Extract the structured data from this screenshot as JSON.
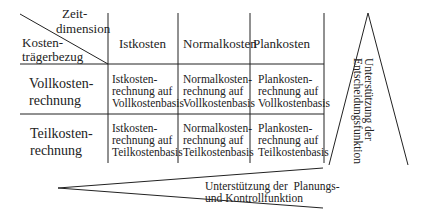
{
  "corner": {
    "top": [
      "Zeit-",
      "dimension"
    ],
    "bottom": [
      "Kosten-",
      "trägerbezug"
    ]
  },
  "columns": [
    "Istkosten",
    "Normalkosten",
    "Plankosten"
  ],
  "rows": [
    {
      "label": [
        "Vollkosten-",
        "rechnung"
      ],
      "cells": [
        [
          "Istkosten-",
          "rechnung auf",
          "Vollkostenbasis"
        ],
        [
          "Normalkosten-",
          "rechnung auf",
          "Vollkostenbasis"
        ],
        [
          "Plankosten-",
          "rechnung auf",
          "Vollkostenbasis"
        ]
      ]
    },
    {
      "label": [
        "Teilkosten-",
        "rechnung"
      ],
      "cells": [
        [
          "Istkosten-",
          "rechnung auf",
          "Teilkostenbasis"
        ],
        [
          "Normalkosten-",
          "rechnung auf",
          "Teilkostenbasis"
        ],
        [
          "Plankosten-",
          "rechnung auf",
          "Teilkostenbasis"
        ]
      ]
    }
  ],
  "vertical_note": [
    "Unterstützung der",
    "Entscheidungsfunktion"
  ],
  "bottom_note": [
    "Unterstützung der  Planungs-",
    "und Kontrollfunktion"
  ]
}
